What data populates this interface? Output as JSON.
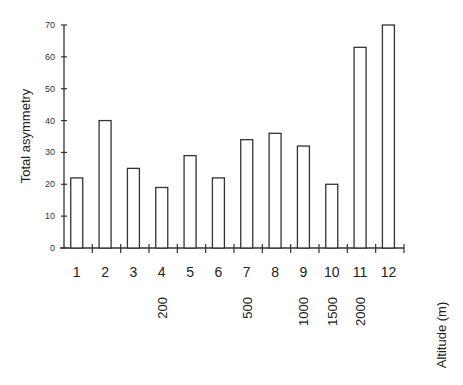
{
  "chart_data": {
    "type": "bar",
    "title": "",
    "xlabel": "Altitude (m)",
    "ylabel": "Total asymmetry",
    "ylim": [
      0,
      70
    ],
    "yticks": [
      0,
      10,
      20,
      30,
      40,
      50,
      60,
      70
    ],
    "grid": false,
    "legend": null,
    "categories": [
      "1",
      "2",
      "3",
      "4",
      "5",
      "6",
      "7",
      "8",
      "9",
      "10",
      "11",
      "12"
    ],
    "values": [
      22,
      40,
      25,
      19,
      29,
      22,
      34,
      36,
      32,
      20,
      63,
      70
    ],
    "altitude_labels": [
      {
        "category": "4",
        "label": "200"
      },
      {
        "category": "7",
        "label": "500"
      },
      {
        "category": "9",
        "label": "1000"
      },
      {
        "category": "10",
        "label": "1500"
      },
      {
        "category": "11",
        "label": "2000"
      }
    ],
    "bar_fill": "#ffffff",
    "bar_stroke": "#333333"
  }
}
